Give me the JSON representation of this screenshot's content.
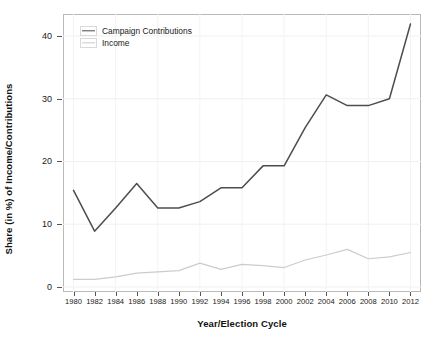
{
  "chart_data": {
    "type": "line",
    "title": "",
    "xlabel": "Year/Election Cycle",
    "ylabel": "Share (in %) of Income/Contributions",
    "x": [
      1980,
      1982,
      1984,
      1986,
      1988,
      1990,
      1992,
      1994,
      1996,
      1998,
      2000,
      2002,
      2004,
      2006,
      2008,
      2010,
      2012
    ],
    "xtick_labels": [
      "1980",
      "1982",
      "1984",
      "1986",
      "1988",
      "1990",
      "1992",
      "1994",
      "1996",
      "1998",
      "2000",
      "2002",
      "2004",
      "2006",
      "2008",
      "2010",
      "2012"
    ],
    "ytick_labels": [
      "0",
      "10",
      "20",
      "30",
      "40"
    ],
    "ytick_values": [
      0,
      10,
      20,
      30,
      40
    ],
    "xlim": [
      1979,
      2013
    ],
    "ylim": [
      -0.8,
      43.5
    ],
    "grid": true,
    "legend_position": "top-left",
    "series": [
      {
        "name": "Campaign Contributions",
        "color": "#4d4d4d",
        "values": [
          15.4,
          8.9,
          12.6,
          16.5,
          12.6,
          12.6,
          13.6,
          15.8,
          15.8,
          19.3,
          19.3,
          25.4,
          30.6,
          28.9,
          28.9,
          30.0,
          41.9
        ]
      },
      {
        "name": "Income",
        "color": "#cccccc",
        "values": [
          1.2,
          1.2,
          1.6,
          2.2,
          2.4,
          2.6,
          3.8,
          2.8,
          3.6,
          3.4,
          3.1,
          4.3,
          5.1,
          6.0,
          4.5,
          4.8,
          5.5
        ]
      }
    ]
  },
  "legend": {
    "items": [
      {
        "label": "Campaign Contributions"
      },
      {
        "label": "Income"
      }
    ]
  }
}
